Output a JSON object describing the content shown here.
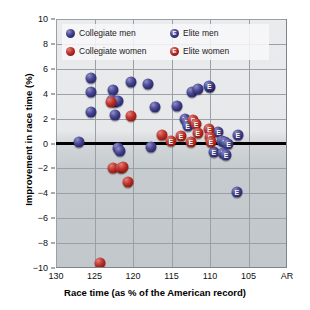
{
  "chart_data": {
    "type": "scatter",
    "title": "",
    "xlabel": "Race time (as % of the American record)",
    "ylabel": "Improvement in race time (%)",
    "xlim": [
      130,
      100
    ],
    "ylim": [
      -10,
      10
    ],
    "x_ticks": [
      "130",
      "125",
      "120",
      "115",
      "110",
      "105",
      "AR"
    ],
    "x_tick_values": [
      130,
      125,
      120,
      115,
      110,
      105,
      100
    ],
    "y_ticks": [
      "10",
      "8",
      "6",
      "4",
      "2",
      "0",
      "−2",
      "−4",
      "−6",
      "−8",
      "−10"
    ],
    "y_tick_values": [
      10,
      8,
      6,
      4,
      2,
      0,
      -2,
      -4,
      -6,
      -8,
      -10
    ],
    "grid": true,
    "x_axis_reversed": true,
    "zero_reference_line": 0,
    "legend_position": "top-left",
    "colors": {
      "men": "#33307a",
      "women": "#a42019",
      "plot_background": "#ccd1d5",
      "gridline": "#9aa0a5",
      "zero_line": "#000000"
    },
    "series": [
      {
        "name": "Collegiate men",
        "marker": "circle",
        "color": "#33307a",
        "points": [
          [
            127.0,
            0.1
          ],
          [
            125.4,
            5.3
          ],
          [
            125.5,
            4.1
          ],
          [
            125.4,
            2.5
          ],
          [
            122.6,
            4.3
          ],
          [
            122.7,
            3.5
          ],
          [
            122.3,
            3.3
          ],
          [
            122.4,
            2.3
          ],
          [
            122.0,
            3.4
          ],
          [
            120.2,
            4.9
          ],
          [
            122.0,
            -0.4
          ],
          [
            121.7,
            -0.6
          ],
          [
            118.1,
            4.8
          ],
          [
            117.2,
            2.9
          ],
          [
            117.6,
            -0.3
          ],
          [
            114.3,
            3.0
          ],
          [
            112.4,
            4.1
          ],
          [
            111.6,
            4.4
          ]
        ]
      },
      {
        "name": "Collegiate women",
        "marker": "circle",
        "color": "#a42019",
        "points": [
          [
            122.8,
            3.3
          ],
          [
            120.2,
            2.2
          ],
          [
            122.6,
            -2.0
          ],
          [
            121.6,
            -2.0
          ],
          [
            121.3,
            -1.9
          ],
          [
            120.7,
            -3.1
          ],
          [
            124.3,
            -9.6
          ],
          [
            116.2,
            0.7
          ]
        ]
      },
      {
        "name": "Elite men",
        "marker": "circle-E",
        "color": "#33307a",
        "points": [
          [
            113.3,
            2.0
          ],
          [
            113.0,
            1.7
          ],
          [
            112.9,
            1.4
          ],
          [
            110.0,
            4.5
          ],
          [
            110.1,
            4.6
          ],
          [
            108.9,
            0.9
          ],
          [
            108.4,
            0.2
          ],
          [
            108.1,
            0.1
          ],
          [
            107.6,
            0.0
          ],
          [
            106.4,
            0.7
          ],
          [
            109.5,
            -0.7
          ],
          [
            108.3,
            -0.8
          ],
          [
            107.9,
            -0.9
          ],
          [
            106.5,
            -3.9
          ]
        ]
      },
      {
        "name": "Elite women",
        "marker": "circle-E",
        "color": "#a42019",
        "points": [
          [
            115.1,
            0.2
          ],
          [
            113.8,
            0.6
          ],
          [
            112.5,
            0.15
          ],
          [
            112.2,
            1.9
          ],
          [
            111.8,
            1.6
          ],
          [
            111.6,
            0.85
          ],
          [
            110.1,
            1.2
          ],
          [
            110.0,
            0.5
          ],
          [
            109.9,
            0.15
          ]
        ]
      }
    ]
  },
  "legend": {
    "entries": [
      {
        "label": "Collegiate men",
        "series": "men",
        "elite": false
      },
      {
        "label": "Elite men",
        "series": "men",
        "elite": true
      },
      {
        "label": "Collegiate women",
        "series": "women",
        "elite": false
      },
      {
        "label": "Elite women",
        "series": "women",
        "elite": true
      }
    ]
  }
}
